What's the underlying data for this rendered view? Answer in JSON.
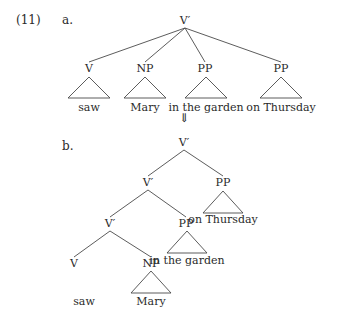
{
  "example": {
    "number": "(11)",
    "number_pos": [
      16,
      24
    ],
    "arrow": "⇓",
    "arrow_pos": [
      184,
      122
    ]
  },
  "trees": [
    {
      "id": "a",
      "label": "a.",
      "label_pos": [
        62,
        24
      ],
      "nodes": [
        {
          "id": "a-root",
          "label": "V′",
          "x": 185,
          "y": 24
        },
        {
          "id": "a-v",
          "label": "V",
          "x": 89,
          "y": 72
        },
        {
          "id": "a-np",
          "label": "NP",
          "x": 145,
          "y": 72
        },
        {
          "id": "a-pp1",
          "label": "PP",
          "x": 205,
          "y": 72
        },
        {
          "id": "a-pp2",
          "label": "PP",
          "x": 281,
          "y": 72
        }
      ],
      "edges": [
        {
          "from": "a-root",
          "to": "a-v"
        },
        {
          "from": "a-root",
          "to": "a-np"
        },
        {
          "from": "a-root",
          "to": "a-pp1"
        },
        {
          "from": "a-root",
          "to": "a-pp2"
        }
      ],
      "triangles": [
        {
          "node": "a-v",
          "x": 89,
          "top": 77,
          "bottom": 98,
          "half": 21,
          "text": "saw",
          "text_y": 111
        },
        {
          "node": "a-np",
          "x": 145,
          "top": 77,
          "bottom": 98,
          "half": 21,
          "text": "Mary",
          "text_y": 111
        },
        {
          "node": "a-pp1",
          "x": 206,
          "top": 77,
          "bottom": 98,
          "half": 21,
          "text": "in the garden",
          "text_y": 111
        },
        {
          "node": "a-pp2",
          "x": 281,
          "top": 77,
          "bottom": 98,
          "half": 21,
          "text": "on Thursday",
          "text_y": 111
        }
      ]
    },
    {
      "id": "b",
      "label": "b.",
      "label_pos": [
        62,
        150
      ],
      "nodes": [
        {
          "id": "b-root",
          "label": "V′",
          "x": 184,
          "y": 146
        },
        {
          "id": "b-v1",
          "label": "V′",
          "x": 148,
          "y": 186
        },
        {
          "id": "b-pp1",
          "label": "PP",
          "x": 223,
          "y": 186
        },
        {
          "id": "b-v2",
          "label": "V′",
          "x": 110,
          "y": 227
        },
        {
          "id": "b-pp2",
          "label": "PP",
          "x": 186,
          "y": 227
        },
        {
          "id": "b-v",
          "label": "V",
          "x": 74,
          "y": 267
        },
        {
          "id": "b-np",
          "label": "NP",
          "x": 151,
          "y": 267
        }
      ],
      "edges": [
        {
          "from": "b-root",
          "to": "b-v1"
        },
        {
          "from": "b-root",
          "to": "b-pp1"
        },
        {
          "from": "b-v1",
          "to": "b-v2"
        },
        {
          "from": "b-v1",
          "to": "b-pp2"
        },
        {
          "from": "b-v2",
          "to": "b-v"
        },
        {
          "from": "b-v2",
          "to": "b-np"
        }
      ],
      "triangles": [
        {
          "node": "b-pp1",
          "x": 223,
          "top": 191,
          "bottom": 213,
          "half": 20,
          "text": "on Thursday",
          "text_y": 223
        },
        {
          "node": "b-pp2",
          "x": 187,
          "top": 231,
          "bottom": 253,
          "half": 20,
          "text": "in the garden",
          "text_y": 264
        },
        {
          "node": "b-np",
          "x": 151,
          "top": 271,
          "bottom": 293,
          "half": 20,
          "text": "Mary",
          "text_y": 305
        }
      ],
      "leaves": [
        {
          "node": "b-v",
          "text": "saw",
          "x": 84,
          "y": 305
        }
      ]
    }
  ]
}
